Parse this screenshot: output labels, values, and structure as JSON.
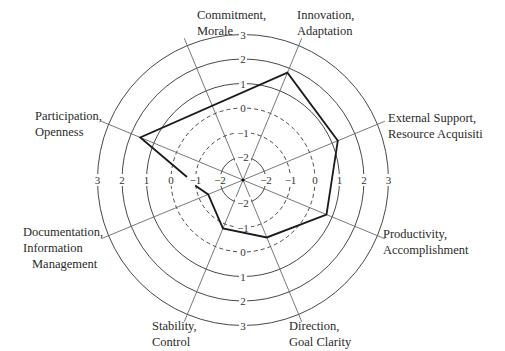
{
  "chart_data": {
    "type": "radar",
    "title": "",
    "center": [
      243,
      180
    ],
    "scale": {
      "min": -2,
      "max": 3,
      "ticks": [
        -2,
        -1,
        0,
        1,
        2,
        3
      ],
      "dashed_ticks": [
        -1,
        0
      ]
    },
    "axes": [
      {
        "label": [
          "Commitment,",
          "Morale"
        ],
        "angle_deg": -22.5,
        "value": 0.3
      },
      {
        "label": [
          "Innovation,",
          "Adaptation"
        ],
        "angle_deg": 22.5,
        "value": 1.8
      },
      {
        "label": [
          "External Support,",
          "Resource Acquisiti"
        ],
        "angle_deg": 67.5,
        "value": 1.25
      },
      {
        "label": [
          "Productivity,",
          "Accomplishment"
        ],
        "angle_deg": 112.5,
        "value": 0.75
      },
      {
        "label": [
          "Direction,",
          "Goal Clarity"
        ],
        "angle_deg": 157.5,
        "value": -0.4
      },
      {
        "label": [
          "Stability,",
          "Control"
        ],
        "angle_deg": -157.5,
        "value": -0.8
      },
      {
        "label": [
          "Documentation,",
          "Information",
          "Management"
        ],
        "angle_deg": -112.5,
        "value": -1.4
      },
      {
        "label": [
          "Participation,",
          "Openness"
        ],
        "angle_deg": -67.5,
        "value": 1.6
      }
    ],
    "series": [
      {
        "name": "Profile",
        "values": [
          0.3,
          1.8,
          1.25,
          0.75,
          -0.4,
          -0.8,
          -1.4,
          1.6
        ]
      }
    ],
    "grid": true,
    "legend": null
  },
  "labels": {
    "commitment": [
      "Commitment,",
      "Morale"
    ],
    "innovation": [
      "Innovation,",
      "Adaptation"
    ],
    "external": [
      "External Support,",
      "Resource Acquisiti"
    ],
    "productivity": [
      "Productivity,",
      "Accomplishment"
    ],
    "direction": [
      "Direction,",
      "Goal Clarity"
    ],
    "stability": [
      "Stability,",
      "Control"
    ],
    "documentation": [
      "Documentation,",
      "Information",
      "Management"
    ],
    "participation": [
      "Participation,",
      "Openness"
    ]
  }
}
